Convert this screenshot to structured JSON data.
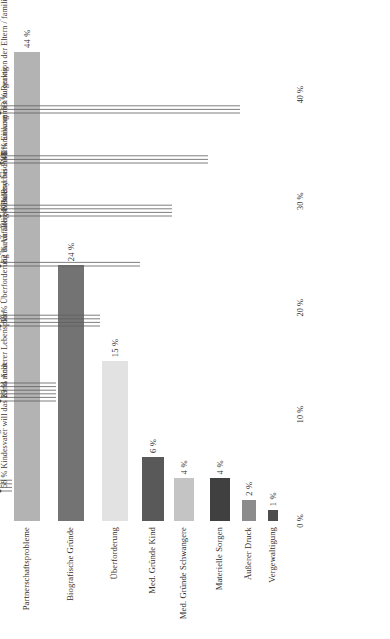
{
  "chart_data": {
    "type": "bar",
    "orientation": "horizontal",
    "title": "",
    "xlabel": "",
    "ylabel": "",
    "xlim": [
      0,
      44
    ],
    "xticks": [
      "0 %",
      "10 %",
      "20 %",
      "30 %",
      "40 %"
    ],
    "xtickvalues": [
      0,
      10,
      20,
      30,
      40
    ],
    "grid": false,
    "legend": "none",
    "categories": [
      "Partnerschaftsprobleme",
      "Biografische Gründe",
      "Überforderung",
      "Med. Gründe Kind",
      "Med. Gründe Schwangere",
      "Materielle Sorgen",
      "Äußerer Druck",
      "Vergewaltigung"
    ],
    "values": [
      44,
      24,
      15,
      6,
      4,
      4,
      2,
      1
    ],
    "value_labels": [
      "44 %",
      "24 %",
      "15 %",
      "6 %",
      "4 %",
      "4 %",
      "2 %",
      "1 %"
    ],
    "bar_colors": [
      "#b3b3b3",
      "#737373",
      "#e2e2e2",
      "#595959",
      "#c4c4c4",
      "#404040",
      "#8c8c8c",
      "#4d4d4d"
    ],
    "sub_items": [
      {
        "category": "Partnerschaftsprobleme",
        "items": [
          "58 % Kindesvater will das Kind nicht",
          "32 % Beziehung frisch / instabil",
          "7 % Affäre / Seitensprung",
          "3 % One-Night-Stand / Keine Beziehung gewünscht"
        ]
      },
      {
        "category": "Biografische Gründe",
        "items": [
          "29 % Anderer Lebensplan",
          "22 % Fühlt sich zu jung",
          "20 % Ausbildung / Schule / Studium",
          "20 % Zukunftsangst / Unsicherheit",
          "6 % Fühlt sich zu alt",
          "3 % Kulturelle Ursache / Flüchtlingsschicksal"
        ]
      },
      {
        "category": "Überforderung",
        "items": [
          "68 % Überforderung durch ältere Kinder",
          "12 % Überforderung wegen Alleinerziehung",
          "12 % Gesundheitliche Überforderung",
          "8 % Berufliche Überforderung / besondere Verpflichtungen"
        ]
      },
      {
        "category": "Med. Gründe Kind",
        "items": [
          "82 % Auffälliger Befund bei PND",
          "18 % Diagnose bei PND"
        ]
      },
      {
        "category": "Med. Gründe Schwangere",
        "items": [
          "49 % Psychische Erkrankung",
          "29 % Körperliche Erkrankung",
          "20 % Probleme in früherer Schwangerschaft",
          "2 % Mehrlingsschwangerschaft"
        ]
      },
      {
        "category": "Materielle Sorgen",
        "items": [
          "48 % Einkommen zu gering",
          "30 % Arbeitslosigkeit / berufliche Unsicherheit",
          "22 % Schulden / Kredite / Wohnungsprobleme"
        ]
      },
      {
        "category": "Äußerer Druck",
        "items": [
          "83 % Reaktion der Eltern / familiärer Druck",
          "16 % Druck durch Dritte (z.B. Freunde / Bekannte)",
          "1 % Druck durch Arbeitgeber"
        ]
      },
      {
        "category": "Vergewaltigung",
        "items": []
      }
    ]
  }
}
